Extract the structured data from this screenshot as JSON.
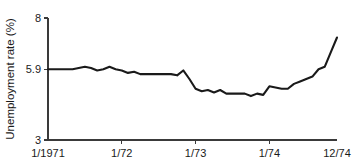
{
  "chart_data": {
    "type": "line",
    "title": "",
    "subtitle": "",
    "xlabel": "",
    "ylabel": "Unemployment rate (%)",
    "grid": false,
    "legend": null,
    "legend_position": "none",
    "ylim": [
      3,
      8
    ],
    "ytick_values": [
      3,
      5.9,
      8
    ],
    "ytick_labels": [
      "3",
      "5.9",
      "8"
    ],
    "xlim": [
      0,
      47
    ],
    "xtick_positions": [
      0,
      12,
      24,
      36,
      47
    ],
    "xtick_labels": [
      "1/1971",
      "1/72",
      "1/73",
      "1/74",
      "12/74"
    ],
    "x": [
      "1/1971",
      "2/1971",
      "3/1971",
      "4/1971",
      "5/1971",
      "6/1971",
      "7/1971",
      "8/1971",
      "9/1971",
      "10/1971",
      "11/1971",
      "12/1971",
      "1/72",
      "2/72",
      "3/72",
      "4/72",
      "5/72",
      "6/72",
      "7/72",
      "8/72",
      "9/72",
      "10/72",
      "11/72",
      "12/72",
      "1/73",
      "2/73",
      "3/73",
      "4/73",
      "5/73",
      "6/73",
      "7/73",
      "8/73",
      "9/73",
      "10/73",
      "11/73",
      "12/73",
      "1/74",
      "2/74",
      "3/74",
      "4/74",
      "5/74",
      "6/74",
      "7/74",
      "8/74",
      "9/74",
      "10/74",
      "11/74",
      "12/74"
    ],
    "values": [
      5.9,
      5.9,
      5.9,
      5.9,
      5.9,
      5.95,
      6.0,
      5.95,
      5.85,
      5.9,
      6.0,
      5.9,
      5.85,
      5.75,
      5.8,
      5.7,
      5.7,
      5.7,
      5.7,
      5.7,
      5.7,
      5.65,
      5.85,
      5.5,
      5.1,
      5.0,
      5.05,
      4.95,
      5.05,
      4.9,
      4.9,
      4.9,
      4.9,
      4.8,
      4.9,
      4.85,
      5.2,
      5.15,
      5.1,
      5.1,
      5.3,
      5.4,
      5.5,
      5.6,
      5.9,
      6.0,
      6.6,
      7.2
    ],
    "series_name": "Unemployment rate",
    "line_color": "#1a1a1a",
    "axis_color": "#3a3a3a",
    "background_color": "#ffffff"
  },
  "geometry": {
    "plot_left": 48,
    "plot_right": 337,
    "plot_top": 18,
    "plot_bottom": 140
  }
}
